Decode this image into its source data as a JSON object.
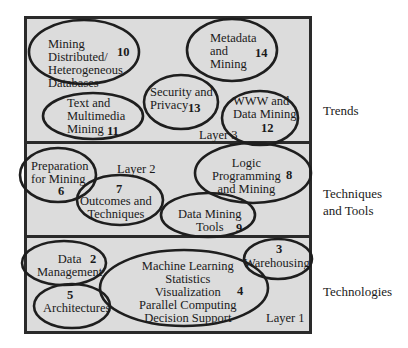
{
  "diagram": {
    "layers": [
      {
        "name": "Layer 3",
        "side_label": "Trends",
        "topics": [
          {
            "number": "10",
            "label": "Mining\nDistributed/\nHeterogeneous\nDatabases"
          },
          {
            "number": "14",
            "label": "Metadata\nand\nMining"
          },
          {
            "number": "13",
            "label": "Security and\nPrivacy"
          },
          {
            "number": "11",
            "label": "Text and\nMultimedia\nMining"
          },
          {
            "number": "12",
            "label": "WWW and\nData Mining"
          }
        ]
      },
      {
        "name": "Layer 2",
        "side_label": "Techniques\nand Tools",
        "topics": [
          {
            "number": "6",
            "label": "Preparation\nfor Mining"
          },
          {
            "number": "7",
            "label": "Outcomes and\nTechniques"
          },
          {
            "number": "8",
            "label": "Logic\nProgramming\nand Mining"
          },
          {
            "number": "9",
            "label": "Data Mining\nTools"
          }
        ]
      },
      {
        "name": "Layer 1",
        "side_label": "Technologies",
        "topics": [
          {
            "number": "2",
            "label": "Data\nManagement"
          },
          {
            "number": "3",
            "label": "Warehousing"
          },
          {
            "number": "4",
            "label": "Machine Learning\nStatistics\nVisualization\nParallel Computing\nDecision Support"
          },
          {
            "number": "5",
            "label": "Architectures"
          }
        ]
      }
    ]
  }
}
